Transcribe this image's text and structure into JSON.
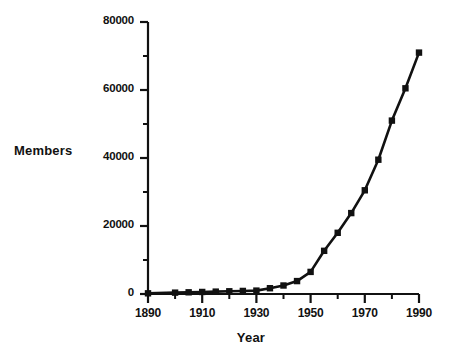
{
  "chart_data": {
    "type": "line",
    "title": "",
    "xlabel": "Year",
    "ylabel": "Members",
    "xlim": [
      1890,
      1990
    ],
    "ylim": [
      0,
      80000
    ],
    "grid": false,
    "legend": null,
    "marker": "filled-square",
    "line_color": "#111111",
    "x": [
      1890,
      1900,
      1905,
      1910,
      1915,
      1920,
      1925,
      1930,
      1935,
      1940,
      1945,
      1950,
      1955,
      1960,
      1965,
      1970,
      1975,
      1980,
      1985,
      1990
    ],
    "values": [
      200,
      400,
      500,
      600,
      700,
      800,
      900,
      1000,
      1700,
      2500,
      3800,
      6500,
      12700,
      18000,
      23800,
      30500,
      39500,
      51000,
      60500,
      71000
    ],
    "series": [
      {
        "name": "Members",
        "values": [
          200,
          400,
          500,
          600,
          700,
          800,
          900,
          1000,
          1700,
          2500,
          3800,
          6500,
          12700,
          18000,
          23800,
          30500,
          39500,
          51000,
          60500,
          71000
        ]
      }
    ],
    "xticks": [
      1890,
      1910,
      1930,
      1950,
      1970,
      1990
    ],
    "xtick_labels": [
      "1890",
      "1910",
      "1930",
      "1950",
      "1970",
      "1990"
    ],
    "xminor_ticks": [
      1900,
      1920,
      1940,
      1960,
      1980
    ],
    "yticks": [
      0,
      20000,
      40000,
      60000,
      80000
    ],
    "ytick_labels": [
      "0",
      "20000",
      "40000",
      "60000",
      "80000"
    ],
    "yminor_ticks": [
      10000,
      30000,
      50000,
      70000
    ]
  },
  "axes": {
    "y_axis_title": "Members",
    "x_axis_title": "Year"
  }
}
